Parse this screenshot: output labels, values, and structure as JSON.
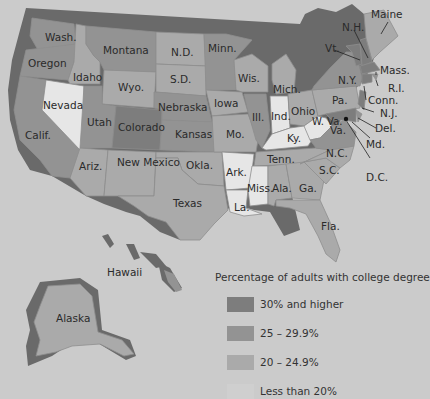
{
  "colors": {
    "high": "#7d7d7d",
    "mid": "#939393",
    "low": "#aaaaaa",
    "lowest": "#e6e6e6",
    "background": "#cbcbcb",
    "coast_shadow": "#6a6a6a"
  },
  "legend": {
    "title": "Percentage of adults with college degree",
    "items": [
      {
        "label": "30% and higher",
        "category": "high"
      },
      {
        "label": "25 – 29.9%",
        "category": "mid"
      },
      {
        "label": "20 – 24.9%",
        "category": "low"
      },
      {
        "label": "Less than 20%",
        "category": "lowest"
      }
    ]
  },
  "states": [
    {
      "label": "Wash.",
      "category": "mid"
    },
    {
      "label": "Oregon",
      "category": "mid"
    },
    {
      "label": "Calif.",
      "category": "mid"
    },
    {
      "label": "Idaho",
      "category": "low"
    },
    {
      "label": "Nevada",
      "category": "lowest"
    },
    {
      "label": "Montana",
      "category": "mid"
    },
    {
      "label": "Wyo.",
      "category": "low"
    },
    {
      "label": "Utah",
      "category": "mid"
    },
    {
      "label": "Colorado",
      "category": "high"
    },
    {
      "label": "Ariz.",
      "category": "low"
    },
    {
      "label": "New Mexico",
      "category": "low"
    },
    {
      "label": "N.D.",
      "category": "low"
    },
    {
      "label": "S.D.",
      "category": "low"
    },
    {
      "label": "Nebraska",
      "category": "mid"
    },
    {
      "label": "Kansas",
      "category": "mid"
    },
    {
      "label": "Okla.",
      "category": "low"
    },
    {
      "label": "Texas",
      "category": "low"
    },
    {
      "label": "Minn.",
      "category": "mid"
    },
    {
      "label": "Iowa",
      "category": "low"
    },
    {
      "label": "Mo.",
      "category": "low"
    },
    {
      "label": "Ark.",
      "category": "lowest"
    },
    {
      "label": "La.",
      "category": "lowest"
    },
    {
      "label": "Wis.",
      "category": "low"
    },
    {
      "label": "Ill.",
      "category": "mid"
    },
    {
      "label": "Mich.",
      "category": "low"
    },
    {
      "label": "Ind.",
      "category": "lowest"
    },
    {
      "label": "Ohio",
      "category": "low"
    },
    {
      "label": "Ky.",
      "category": "lowest"
    },
    {
      "label": "Tenn.",
      "category": "low"
    },
    {
      "label": "Miss.",
      "category": "lowest"
    },
    {
      "label": "Ala.",
      "category": "low"
    },
    {
      "label": "Ga.",
      "category": "low"
    },
    {
      "label": "Fla.",
      "category": "low"
    },
    {
      "label": "S.C.",
      "category": "low"
    },
    {
      "label": "N.C.",
      "category": "low"
    },
    {
      "label": "W. Va.",
      "category": "lowest"
    },
    {
      "label": "Va.",
      "category": "mid"
    },
    {
      "label": "Pa.",
      "category": "low"
    },
    {
      "label": "N.Y.",
      "category": "mid"
    },
    {
      "label": "Vt.",
      "category": "high"
    },
    {
      "label": "N.H.",
      "category": "high"
    },
    {
      "label": "Maine",
      "category": "low"
    },
    {
      "label": "Mass.",
      "category": "high"
    },
    {
      "label": "R.I.",
      "category": "mid"
    },
    {
      "label": "Conn.",
      "category": "high"
    },
    {
      "label": "N.J.",
      "category": "high"
    },
    {
      "label": "Del.",
      "category": "mid"
    },
    {
      "label": "Md.",
      "category": "high"
    },
    {
      "label": "D.C.",
      "category": "high"
    },
    {
      "label": "Alaska",
      "category": "low"
    },
    {
      "label": "Hawaii",
      "category": "mid"
    }
  ]
}
